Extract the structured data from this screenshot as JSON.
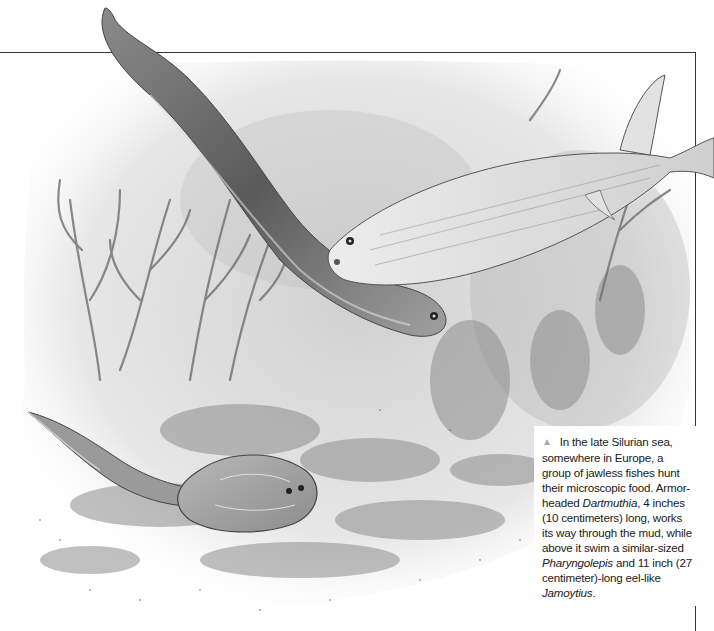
{
  "figure": {
    "subjects": [
      {
        "name": "Jamoytius",
        "role": "eel-like fish swimming diagonally"
      },
      {
        "name": "Pharyngolepis",
        "role": "fish swimming near top right"
      },
      {
        "name": "Dartmuthia",
        "role": "armor-headed fish on the mud, bottom left"
      }
    ],
    "colors": {
      "frame_line": "#333333",
      "triangle_marker": "#a8a8a8",
      "text": "#1a1a1a",
      "background": "#ffffff"
    }
  },
  "caption": {
    "marker_icon": "▲",
    "parts": {
      "p1": "In the late Silurian sea, somewhere in Europe, a group of jawless fishes hunt their microscopic food. Armor-headed ",
      "taxon1": "Dartmuthia",
      "p2": ", 4 inches (10 centimeters) long, works its way through the mud, while above it swim a similar-sized ",
      "taxon2": "Pharyngolepis",
      "p3": " and 11 inch (27 centimeter)-long eel-like ",
      "taxon3": "Jamoytius",
      "p4": "."
    }
  }
}
